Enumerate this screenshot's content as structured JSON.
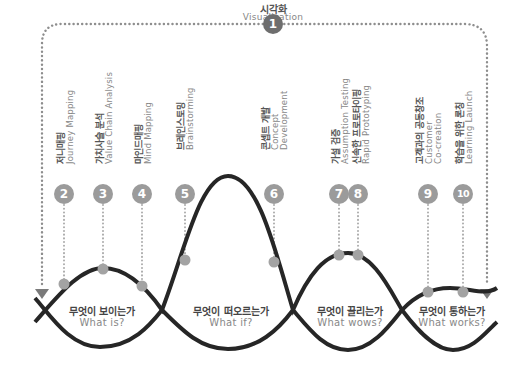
{
  "title": {
    "ko": "시각화",
    "en": "Visualization",
    "number": "1"
  },
  "methods": [
    {
      "number": "2",
      "ko": "저니매핑",
      "en": "Journey Mapping"
    },
    {
      "number": "3",
      "ko": "가치사슬 분석",
      "en": "Value Chain Analysis"
    },
    {
      "number": "4",
      "ko": "마인드매핑",
      "en": "Mind Mapping"
    },
    {
      "number": "5",
      "ko": "브레인스토밍",
      "en": "Brainstorming"
    },
    {
      "number": "6",
      "ko": "콘셉트 개발",
      "en": "Concept",
      "en2": "Development"
    },
    {
      "number": "7",
      "ko": "가설 검증",
      "en": "Assumption Testing"
    },
    {
      "number": "8",
      "ko": "신속한 프로토타이핑",
      "en": "Rapid Prototyping"
    },
    {
      "number": "9",
      "ko": "고객과의 공동창조",
      "en": "Customer",
      "en2": "Co-creation"
    },
    {
      "number": "10",
      "ko": "학습을 위한 론칭",
      "en": "Learning Launch"
    }
  ],
  "stages": [
    {
      "ko": "무엇이 보이는가",
      "en": "What is?"
    },
    {
      "ko": "무엇이 떠오르는가",
      "en": "What if?"
    },
    {
      "ko": "무엇이 끌리는가",
      "en": "What wows?"
    },
    {
      "ko": "무엇이 통하는가",
      "en": "What works?"
    }
  ],
  "colors": {
    "curve": "#262626",
    "marker": "#a3a3a3",
    "dotted": "#9a9a9a",
    "primary_circle": "#6e6e6e",
    "arrow": "#7a7a7a"
  }
}
